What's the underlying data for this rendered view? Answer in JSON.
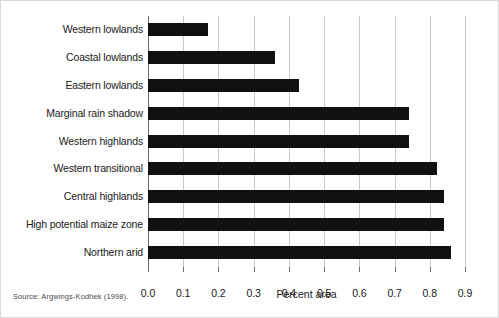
{
  "chart_data": {
    "type": "bar",
    "orientation": "horizontal",
    "title": "",
    "xlabel": "Percent area",
    "ylabel": "",
    "categories": [
      "Western lowlands",
      "Coastal lowlands",
      "Eastern lowlands",
      "Marginal rain shadow",
      "Western highlands",
      "Western transitional",
      "Central highlands",
      "High potential maize zone",
      "Northern arid"
    ],
    "values": [
      0.17,
      0.36,
      0.43,
      0.74,
      0.74,
      0.82,
      0.84,
      0.84,
      0.86
    ],
    "xlim": [
      0.0,
      0.9
    ],
    "xticks": [
      "0.0",
      "0.1",
      "0.2",
      "0.3",
      "0.4",
      "0.5",
      "0.6",
      "0.7",
      "0.8",
      "0.9"
    ],
    "xtick_values": [
      0.0,
      0.1,
      0.2,
      0.3,
      0.4,
      0.5,
      0.6,
      0.7,
      0.8,
      0.9
    ],
    "grid": "vertical",
    "legend": "none",
    "bar_color": "#111111",
    "gridline_color": "#c8c8c8",
    "axis_color": "#6e6e6e"
  },
  "caption": {
    "source": "Source: Argwings-Kodhek (1998)."
  }
}
